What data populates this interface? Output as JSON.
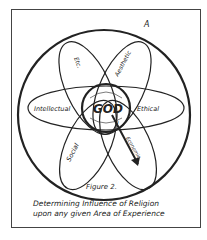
{
  "diagram": {
    "outer_label": "A",
    "center_label": "GOD",
    "petals": [
      {
        "label": "Etc."
      },
      {
        "label": "Aesthetic"
      },
      {
        "label": "Intellectual"
      },
      {
        "label": "Ethical"
      },
      {
        "label": "Social"
      },
      {
        "label": "Economic"
      }
    ],
    "point_label": "a"
  },
  "caption": {
    "figure": "Figure 2.",
    "line1": "Determining Influence of Religion",
    "line2": "upon any given Area of Experience"
  }
}
